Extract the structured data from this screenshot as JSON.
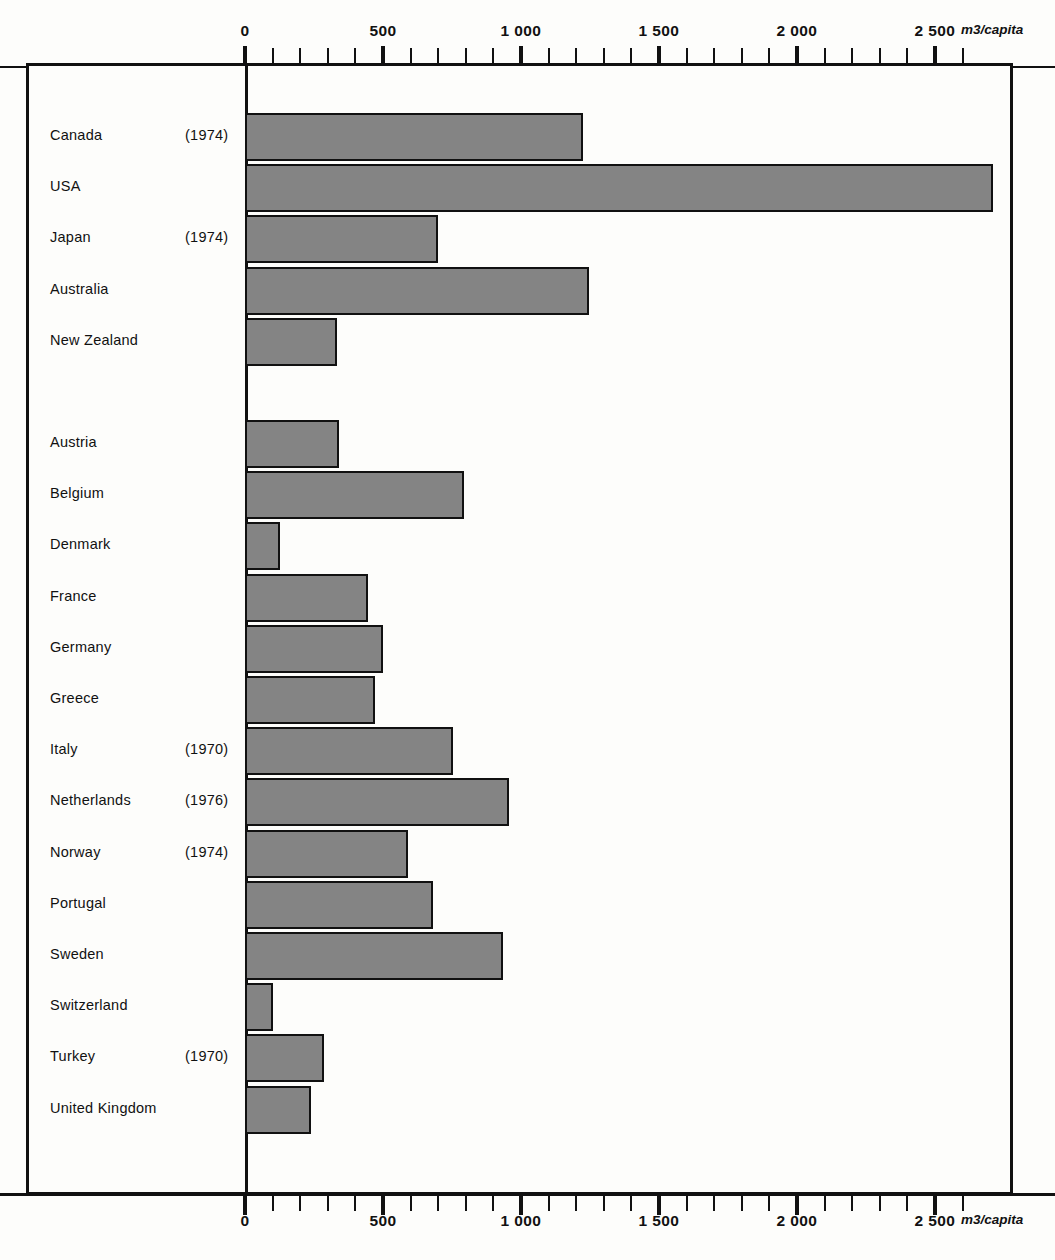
{
  "chart_data": {
    "type": "bar",
    "orientation": "horizontal",
    "title": "",
    "xlabel": "m3/capita",
    "ylabel": "",
    "xlim": [
      0,
      2750
    ],
    "grid": false,
    "legend": null,
    "unit_label": "m3/capita",
    "axis_positions": [
      "top",
      "bottom"
    ],
    "tick_labels": [
      "0",
      "500",
      "1 000",
      "1 500",
      "2 000",
      "2 500"
    ],
    "tick_values": [
      0,
      500,
      1000,
      1500,
      2000,
      2500
    ],
    "minor_tick_step": 100,
    "categories": [
      "Canada",
      "USA",
      "Japan",
      "Australia",
      "New Zealand",
      "Austria",
      "Belgium",
      "Denmark",
      "France",
      "Germany",
      "Greece",
      "Italy",
      "Netherlands",
      "Norway",
      "Portugal",
      "Sweden",
      "Switzerland",
      "Turkey",
      "United Kingdom"
    ],
    "values": [
      1225,
      2710,
      700,
      1245,
      335,
      340,
      795,
      125,
      445,
      500,
      470,
      755,
      955,
      590,
      680,
      935,
      100,
      285,
      240
    ],
    "annotations": [
      {
        "category": "Canada",
        "note": "(1974)"
      },
      {
        "category": "Japan",
        "note": "(1974)"
      },
      {
        "category": "Italy",
        "note": "(1970)"
      },
      {
        "category": "Netherlands",
        "note": "(1976)"
      },
      {
        "category": "Norway",
        "note": "(1974)"
      },
      {
        "category": "Turkey",
        "note": "(1970)"
      }
    ],
    "groups": [
      {
        "name": "",
        "categories": [
          "Canada",
          "USA",
          "Japan",
          "Australia",
          "New Zealand"
        ]
      },
      {
        "name": "",
        "categories": [
          "Austria",
          "Belgium",
          "Denmark",
          "France",
          "Germany",
          "Greece",
          "Italy",
          "Netherlands",
          "Norway",
          "Portugal",
          "Sweden",
          "Switzerland",
          "Turkey",
          "United Kingdom"
        ]
      }
    ],
    "colors": {
      "bar_fill": "#848484",
      "bar_stroke": "#111111",
      "background": "#fdfdfb"
    }
  },
  "rows": [
    {
      "label": "Canada",
      "year": "(1974)",
      "value": 1225
    },
    {
      "label": "USA",
      "year": "",
      "value": 2710
    },
    {
      "label": "Japan",
      "year": "(1974)",
      "value": 700
    },
    {
      "label": "Australia",
      "year": "",
      "value": 1245
    },
    {
      "label": "New Zealand",
      "year": "",
      "value": 335
    },
    {
      "label": "Austria",
      "year": "",
      "value": 340
    },
    {
      "label": "Belgium",
      "year": "",
      "value": 795
    },
    {
      "label": "Denmark",
      "year": "",
      "value": 125
    },
    {
      "label": "France",
      "year": "",
      "value": 445
    },
    {
      "label": "Germany",
      "year": "",
      "value": 500
    },
    {
      "label": "Greece",
      "year": "",
      "value": 470
    },
    {
      "label": "Italy",
      "year": "(1970)",
      "value": 755
    },
    {
      "label": "Netherlands",
      "year": "(1976)",
      "value": 955
    },
    {
      "label": "Norway",
      "year": "(1974)",
      "value": 590
    },
    {
      "label": "Portugal",
      "year": "",
      "value": 680
    },
    {
      "label": "Sweden",
      "year": "",
      "value": 935
    },
    {
      "label": "Switzerland",
      "year": "",
      "value": 100
    },
    {
      "label": "Turkey",
      "year": "(1970)",
      "value": 285
    },
    {
      "label": "United Kingdom",
      "year": "",
      "value": 240
    }
  ],
  "axis": {
    "unit": "m3/capita",
    "ticks": [
      {
        "label": "0",
        "value": 0
      },
      {
        "label": "500",
        "value": 500
      },
      {
        "label": "1 000",
        "value": 1000
      },
      {
        "label": "1 500",
        "value": 1500
      },
      {
        "label": "2 000",
        "value": 2000
      },
      {
        "label": "2 500",
        "value": 2500
      }
    ]
  }
}
